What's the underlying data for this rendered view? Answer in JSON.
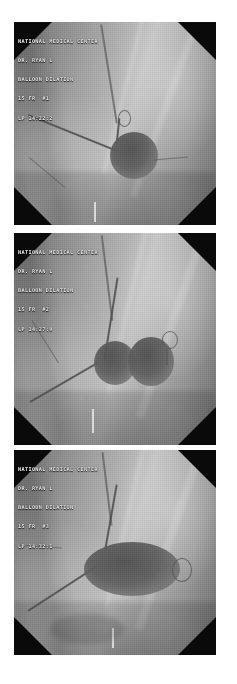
{
  "document": {
    "kind": "fluoroscopy-image-series",
    "panel_count": 3,
    "orientation": "vertical-stack",
    "background_color": "#ffffff",
    "frame_color": "#000000"
  },
  "panels": [
    {
      "id": "panel-1",
      "sequence_label": "1",
      "overlay": {
        "lines": [
          "NATIONAL MEDICAL CENTER",
          "DR. RYAN L",
          "BALLOON DILATION",
          "15 FR  #1",
          "LP 14:22:2"
        ],
        "line_1": "NATIONAL MEDICAL CENTER",
        "line_2": "DR. RYAN L",
        "line_3": "BALLOON DILATION",
        "line_4": "15 FR  #1",
        "line_5": "LP 14:22:2"
      },
      "finding": "single round radiodense mass with catheter entering superiorly"
    },
    {
      "id": "panel-2",
      "sequence_label": "2",
      "overlay": {
        "lines": [
          "NATIONAL MEDICAL CENTER",
          "DR. RYAN L",
          "BALLOON DILATION",
          "15 FR  #2",
          "LP 14:27:0"
        ],
        "line_1": "NATIONAL MEDICAL CENTER",
        "line_2": "DR. RYAN L",
        "line_3": "BALLOON DILATION",
        "line_4": "15 FR  #2",
        "line_5": "LP 14:27:0"
      },
      "finding": "two adjacent round radiodense masses with waist between them"
    },
    {
      "id": "panel-3",
      "sequence_label": "3",
      "overlay": {
        "lines": [
          "NATIONAL MEDICAL CENTER",
          "DR. RYAN L",
          "BALLOON DILATION",
          "15 FR  #3",
          "LP 14:32:1"
        ],
        "line_1": "NATIONAL MEDICAL CENTER",
        "line_2": "DR. RYAN L",
        "line_3": "BALLOON DILATION",
        "line_4": "15 FR  #3",
        "line_5": "LP 14:32:1"
      },
      "finding": "single elongated oval radiodense mass with pigtail catheter loop at right"
    }
  ]
}
